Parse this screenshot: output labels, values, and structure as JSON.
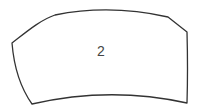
{
  "diagram": {
    "shape": {
      "type": "curved-quadrilateral",
      "stroke": "#333333",
      "fill": "#ffffff",
      "label": "2"
    }
  }
}
